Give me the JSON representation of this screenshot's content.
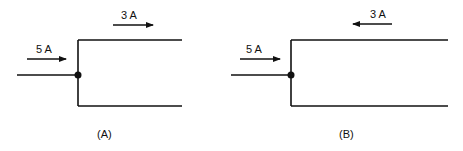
{
  "diagram": {
    "type": "circuit-junction",
    "panels": [
      {
        "id": "A",
        "caption": "(A)",
        "input_current": {
          "label": "5 A",
          "direction": "right"
        },
        "branch_current": {
          "label": "3 A",
          "direction": "right"
        }
      },
      {
        "id": "B",
        "caption": "(B)",
        "input_current": {
          "label": "5 A",
          "direction": "right"
        },
        "branch_current": {
          "label": "3 A",
          "direction": "left"
        }
      }
    ],
    "colors": {
      "line": "#111111",
      "background": "#ffffff"
    }
  }
}
